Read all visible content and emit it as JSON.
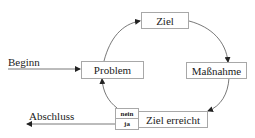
{
  "diagram": {
    "type": "cycle",
    "nodes": {
      "ziel": "Ziel",
      "massnahme": "Maßnahme",
      "ziel_erreicht": "Ziel erreicht",
      "problem": "Problem"
    },
    "decision": {
      "no": "nein",
      "yes": "ja"
    },
    "entry_label": "Beginn",
    "exit_label": "Abschluss",
    "edges": [
      {
        "from": "Beginn",
        "to": "Problem"
      },
      {
        "from": "Problem",
        "to": "Ziel"
      },
      {
        "from": "Ziel",
        "to": "Maßnahme"
      },
      {
        "from": "Maßnahme",
        "to": "Ziel erreicht"
      },
      {
        "from": "Ziel erreicht",
        "to": "Problem",
        "condition": "nein"
      },
      {
        "from": "Ziel erreicht",
        "to": "Abschluss",
        "condition": "ja"
      }
    ]
  }
}
